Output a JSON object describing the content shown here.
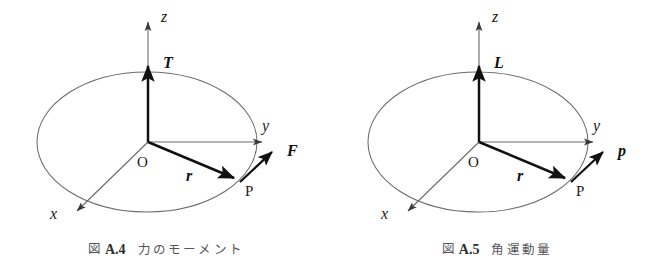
{
  "figures": [
    {
      "id": "fig-a4",
      "caption": {
        "mark": "図",
        "number": "A.4",
        "title": "力のモーメント"
      },
      "axes": {
        "z": "z",
        "y": "y",
        "x": "x"
      },
      "origin_label": "O",
      "point_label": "P",
      "vectors": {
        "axis_vector": "T",
        "position_vector": "r",
        "applied_vector": "F"
      },
      "colors": {
        "ellipse_stroke": "#6b6b6b",
        "axis_stroke": "#6a6a6a",
        "vector_stroke": "#111111",
        "background": "#ffffff"
      }
    },
    {
      "id": "fig-a5",
      "caption": {
        "mark": "図",
        "number": "A.5",
        "title": "角運動量"
      },
      "axes": {
        "z": "z",
        "y": "y",
        "x": "x"
      },
      "origin_label": "O",
      "point_label": "P",
      "vectors": {
        "axis_vector": "L",
        "position_vector": "r",
        "applied_vector": "p"
      },
      "colors": {
        "ellipse_stroke": "#6b6b6b",
        "axis_stroke": "#6a6a6a",
        "vector_stroke": "#111111",
        "background": "#ffffff"
      }
    }
  ],
  "geometry": {
    "ellipse": {
      "cx": 147,
      "cy": 142,
      "rx": 110,
      "ry": 70
    },
    "origin": {
      "x": 148,
      "y": 142
    },
    "point_p": {
      "x": 240,
      "y": 182
    },
    "z_axis_tip": {
      "y": 17
    },
    "y_axis_tip": {
      "x": 267
    },
    "x_axis_tip": {
      "x": 73,
      "y": 215
    },
    "axis_vector_tip": {
      "y": 62
    },
    "applied_vector_tip": {
      "x": 277,
      "y": 148
    }
  }
}
